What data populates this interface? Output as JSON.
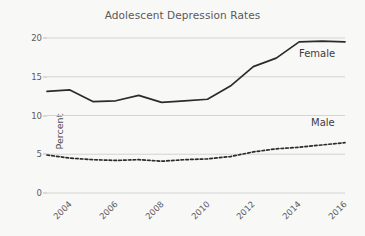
{
  "chart_data": {
    "type": "line",
    "title": "Adolescent Depression Rates",
    "xlabel": "",
    "ylabel": "Percent",
    "xlim": [
      2004,
      2017
    ],
    "ylim": [
      0,
      20
    ],
    "yticks": [
      0,
      5,
      10,
      15,
      20
    ],
    "xticks": [
      2004,
      2006,
      2008,
      2010,
      2012,
      2014,
      2016
    ],
    "grid": "horizontal",
    "legend_position": "inline-end-labels",
    "x": [
      2004,
      2005,
      2006,
      2007,
      2008,
      2009,
      2010,
      2011,
      2012,
      2013,
      2014,
      2015,
      2016,
      2017
    ],
    "series": [
      {
        "name": "Female",
        "style": "solid",
        "color": "#2b2b2b",
        "values": [
          13.1,
          13.3,
          11.8,
          11.9,
          12.6,
          11.7,
          11.9,
          12.1,
          13.8,
          16.3,
          17.4,
          19.5,
          19.6,
          19.5
        ]
      },
      {
        "name": "Male",
        "style": "dashed",
        "color": "#2b2b2b",
        "values": [
          4.9,
          4.5,
          4.3,
          4.2,
          4.3,
          4.1,
          4.3,
          4.4,
          4.7,
          5.3,
          5.7,
          5.9,
          6.2,
          6.5
        ]
      }
    ]
  },
  "labels": {
    "y_ticks": [
      "0",
      "5",
      "10",
      "15",
      "20"
    ],
    "x_ticks": [
      "2004",
      "2006",
      "2008",
      "2010",
      "2012",
      "2014",
      "2016"
    ],
    "female": "Female",
    "male": "Male"
  },
  "colors": {
    "background": "#f8f8f7",
    "grid": "#cfcfcd",
    "line": "#2b2b2b",
    "title_text": "#59595b",
    "tick_text": "#5b5b5d"
  }
}
